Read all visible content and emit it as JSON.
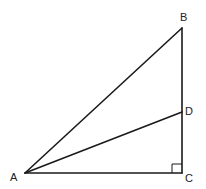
{
  "diagram": {
    "type": "right-triangle",
    "points": {
      "A": {
        "label": "A",
        "x": 25,
        "y": 173
      },
      "B": {
        "label": "B",
        "x": 182,
        "y": 28
      },
      "C": {
        "label": "C",
        "x": 182,
        "y": 173
      },
      "D": {
        "label": "D",
        "x": 182,
        "y": 112
      }
    },
    "segments": [
      "AB",
      "BC",
      "CA",
      "AD"
    ],
    "right_angle_at": "C",
    "labels": {
      "A": "A",
      "B": "B",
      "C": "C",
      "D": "D"
    }
  }
}
